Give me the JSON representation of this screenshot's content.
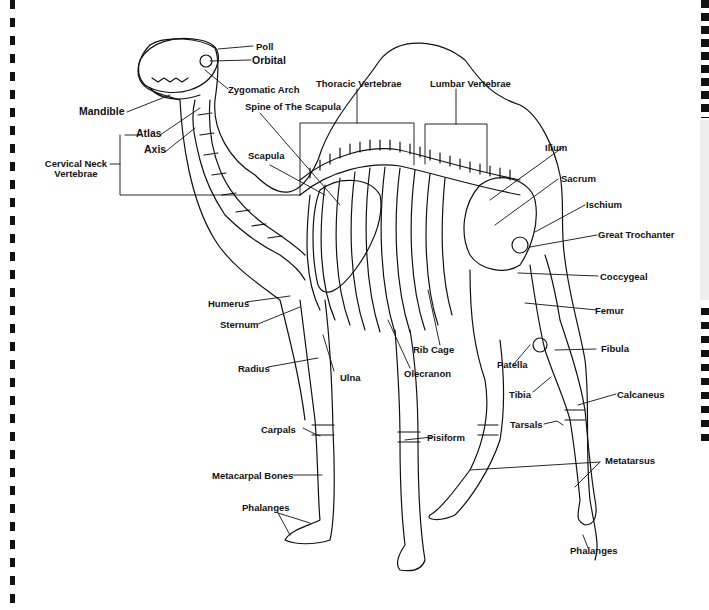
{
  "diagram": {
    "line_color": "#111111",
    "background": "#ffffff",
    "labels": {
      "poll": "Poll",
      "orbital": "Orbital",
      "zygomatic_arch": "Zygomatic Arch",
      "mandible": "Mandible",
      "atlas": "Atlas",
      "axis": "Axis",
      "cervical_neck_vertebrae_1": "Cervical Neck",
      "cervical_neck_vertebrae_2": "Vertebrae",
      "thoracic_vertebrae": "Thoracic Vertebrae",
      "lumbar_vertebrae": "Lumbar Vertebrae",
      "spine_of_scapula": "Spine of The Scapula",
      "scapula": "Scapula",
      "ilium": "Ilium",
      "sacrum": "Sacrum",
      "ischium": "Ischium",
      "great_trochanter": "Great Trochanter",
      "coccygeal": "Coccygeal",
      "femur": "Femur",
      "humerus": "Humerus",
      "sternum": "Sternum",
      "rib_cage": "Rib Cage",
      "olecranon": "Olecranon",
      "patella": "Patella",
      "fibula": "Fibula",
      "radius": "Radius",
      "ulna": "Ulna",
      "tibia": "Tibia",
      "calcaneus": "Calcaneus",
      "tarsals": "Tarsals",
      "carpals": "Carpals",
      "pisiform": "Pisiform",
      "metacarpal_bones": "Metacarpal Bones",
      "metatarsus": "Metatarsus",
      "phalanges_front": "Phalanges",
      "phalanges_rear": "Phalanges"
    }
  }
}
